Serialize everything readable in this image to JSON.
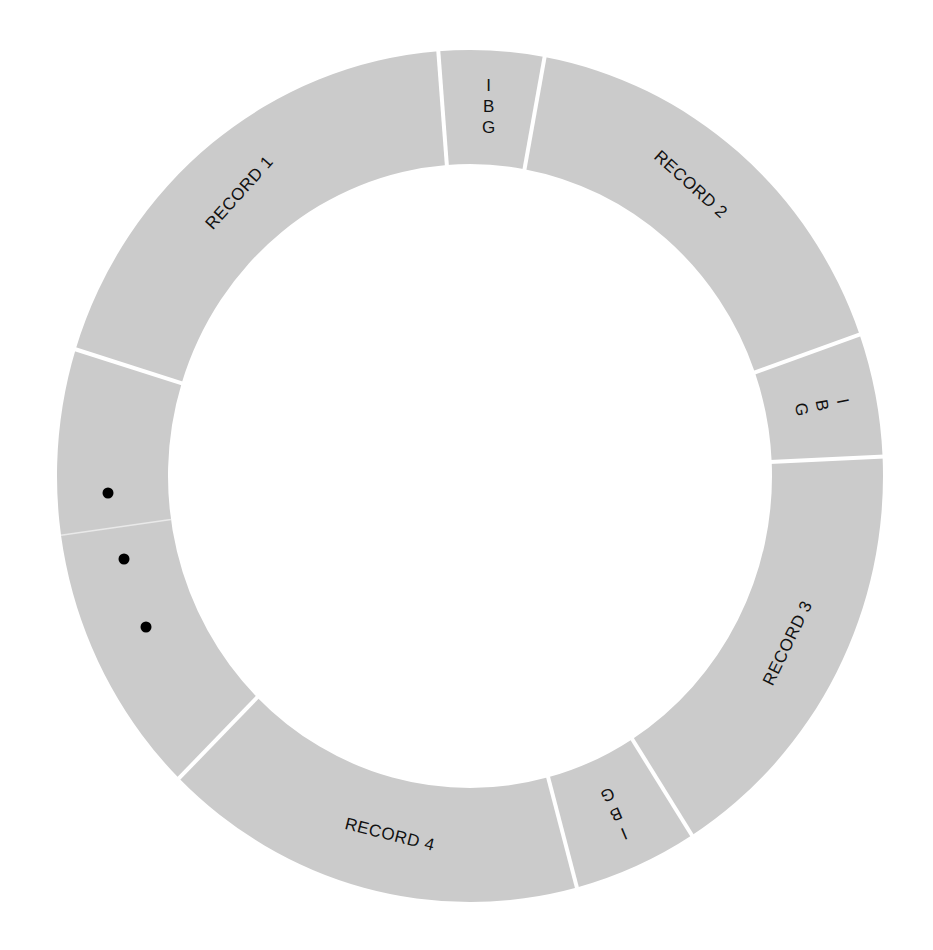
{
  "diagram": {
    "title": "",
    "type": "circular-track",
    "colors": {
      "ring": "#cbcbcb",
      "divider": "#ffffff",
      "text": "#111111",
      "background": "#ffffff"
    },
    "geometry": {
      "cx": 470,
      "cy": 476,
      "outer_rx": 413,
      "outer_ry": 426,
      "inner_rx": 302,
      "inner_ry": 312
    },
    "segments": [
      {
        "id": "record-1",
        "kind": "record",
        "label": "RECORD 1",
        "start_deg": 197.3,
        "end_deg": 265.6,
        "label_deg": 230,
        "label_rot": -48,
        "label_size": 17
      },
      {
        "id": "gap-1",
        "kind": "gap",
        "label_lines": [
          "I",
          "B",
          "G"
        ],
        "start_deg": 265.6,
        "end_deg": 280.4,
        "label_deg": 273,
        "label_rot": 0,
        "label_size": 17
      },
      {
        "id": "record-2",
        "kind": "record",
        "label": "RECORD 2",
        "start_deg": 280.4,
        "end_deg": 340.6,
        "label_deg": 308,
        "label_rot": 42,
        "label_size": 17
      },
      {
        "id": "gap-2",
        "kind": "gap",
        "label_lines": [
          "I",
          "B",
          "G"
        ],
        "start_deg": 340.6,
        "end_deg": 357.4,
        "label_deg": 349,
        "label_rot": 79,
        "label_size": 17
      },
      {
        "id": "record-3",
        "kind": "record",
        "label": "RECORD 3",
        "start_deg": 357.4,
        "end_deg": 417.5,
        "label_deg": 27,
        "label_rot": -64,
        "label_size": 17
      },
      {
        "id": "gap-3",
        "kind": "gap",
        "label_lines": [
          "I",
          "B",
          "G"
        ],
        "start_deg": 417.5,
        "end_deg": 435.0,
        "label_deg": 66,
        "label_rot": 157,
        "label_size": 17
      },
      {
        "id": "record-4",
        "kind": "record",
        "label": "RECORD 4",
        "start_deg": 435.0,
        "end_deg": 494.8,
        "label_deg": 103,
        "label_rot": 14,
        "label_size": 17
      },
      {
        "id": "continuation",
        "kind": "ellipsis",
        "label": "",
        "start_deg": 494.8,
        "end_deg": 557.3
      }
    ],
    "faint_dividers": [
      {
        "deg": 172
      }
    ],
    "ellipsis_dots": [
      {
        "x": 108,
        "y": 493
      },
      {
        "x": 124,
        "y": 559
      },
      {
        "x": 146,
        "y": 627
      }
    ]
  }
}
